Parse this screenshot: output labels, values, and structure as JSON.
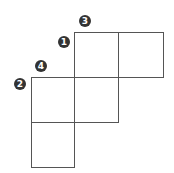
{
  "diagram": {
    "line_color": "#555555",
    "badge_color": "#333333",
    "badges": [
      {
        "label": "1",
        "x": 58,
        "y": 36
      },
      {
        "label": "2",
        "x": 14,
        "y": 78
      },
      {
        "label": "3",
        "x": 79,
        "y": 15
      },
      {
        "label": "4",
        "x": 35,
        "y": 60
      }
    ]
  }
}
